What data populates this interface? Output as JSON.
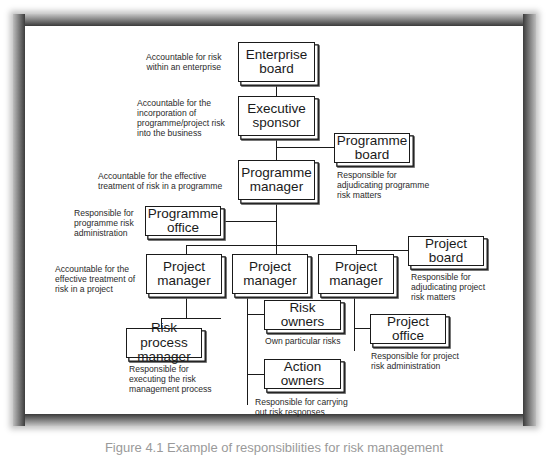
{
  "diagram": {
    "type": "organization-chart",
    "nodes": [
      {
        "id": "enterprise_board",
        "lines": [
          "Enterprise",
          "board"
        ],
        "note": [
          "Accountable for risk",
          "within an enterprise"
        ]
      },
      {
        "id": "executive_sponsor",
        "lines": [
          "Executive",
          "sponsor"
        ],
        "note": [
          "Accountable for the",
          "incorporation of",
          "programme/project risk",
          "into the business"
        ]
      },
      {
        "id": "programme_board",
        "lines": [
          "Programme",
          "board"
        ],
        "note": [
          "Responsible for",
          "adjudicating programme",
          "risk matters"
        ]
      },
      {
        "id": "programme_manager",
        "lines": [
          "Programme",
          "manager"
        ],
        "note": [
          "Accountable for the effective",
          "treatment of risk in a programme"
        ]
      },
      {
        "id": "programme_office",
        "lines": [
          "Programme",
          "office"
        ],
        "note": [
          "Responsible for",
          "programme risk",
          "administration"
        ]
      },
      {
        "id": "project_manager_1",
        "lines": [
          "Project",
          "manager"
        ],
        "note": [
          "Accountable for the",
          "effective treatment of",
          "risk in a project"
        ]
      },
      {
        "id": "project_manager_2",
        "lines": [
          "Project",
          "manager"
        ]
      },
      {
        "id": "project_manager_3",
        "lines": [
          "Project",
          "manager"
        ]
      },
      {
        "id": "project_board",
        "lines": [
          "Project",
          "board"
        ],
        "note": [
          "Responsible for",
          "adjudicating project",
          "risk matters"
        ]
      },
      {
        "id": "risk_process_manager",
        "lines": [
          "Risk process",
          "manager"
        ],
        "note": [
          "Responsible for",
          "executing the risk",
          "management process"
        ]
      },
      {
        "id": "risk_owners",
        "lines": [
          "Risk",
          "owners"
        ],
        "note": [
          "Own particular risks"
        ]
      },
      {
        "id": "project_office",
        "lines": [
          "Project",
          "office"
        ],
        "note": [
          "Responsible for project",
          "risk administration"
        ]
      },
      {
        "id": "action_owners",
        "lines": [
          "Action",
          "owners"
        ],
        "note": [
          "Responsible for carrying",
          "out risk responses"
        ]
      }
    ],
    "edges": [
      [
        "enterprise_board",
        "executive_sponsor"
      ],
      [
        "executive_sponsor",
        "programme_manager"
      ],
      [
        "executive_sponsor",
        "programme_board"
      ],
      [
        "programme_manager",
        "programme_office"
      ],
      [
        "programme_manager",
        "project_manager_1"
      ],
      [
        "programme_manager",
        "project_manager_2"
      ],
      [
        "programme_manager",
        "project_manager_3"
      ],
      [
        "project_manager_3",
        "project_board"
      ],
      [
        "project_manager_1",
        "risk_process_manager"
      ],
      [
        "project_manager_2",
        "risk_owners"
      ],
      [
        "project_manager_2",
        "action_owners"
      ],
      [
        "project_manager_3",
        "project_office"
      ]
    ]
  },
  "caption": "Figure 4.1  Example of responsibilities for risk management"
}
